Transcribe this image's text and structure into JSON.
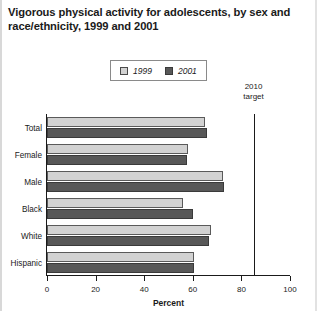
{
  "chart_data": {
    "type": "bar",
    "orientation": "horizontal",
    "title": "Vigorous physical activity for adolescents, by sex and race/ethnicity, 1999 and 2001",
    "xlabel": "Percent",
    "ylabel": "",
    "xlim": [
      0,
      100
    ],
    "xticks": [
      0,
      20,
      40,
      60,
      80,
      100
    ],
    "xtick_labels": [
      "0",
      "20",
      "40",
      "60",
      "80",
      "100"
    ],
    "grid": false,
    "legend_position": "top-center",
    "categories": [
      "Total",
      "Female",
      "Male",
      "Black",
      "White",
      "Hispanic"
    ],
    "series": [
      {
        "name": "1999",
        "color": "#d2d2d2",
        "values": [
          65,
          58,
          72.5,
          56,
          67.5,
          60.5
        ]
      },
      {
        "name": "2001",
        "color": "#585858",
        "values": [
          66,
          57.5,
          73,
          60,
          66.5,
          60.5
        ]
      }
    ],
    "annotations": [
      {
        "name": "2010-target",
        "line1": "2010",
        "line2": "target",
        "value": 85
      }
    ]
  },
  "legend": {
    "items": [
      {
        "label": "1999",
        "swatch": "light-gray-swatch"
      },
      {
        "label": "2001",
        "swatch": "dark-gray-swatch"
      }
    ]
  },
  "axis": {
    "x_title": "Percent",
    "ticks": [
      "0",
      "20",
      "40",
      "60",
      "80",
      "100"
    ]
  },
  "target": {
    "line1": "2010",
    "line2": "target"
  }
}
